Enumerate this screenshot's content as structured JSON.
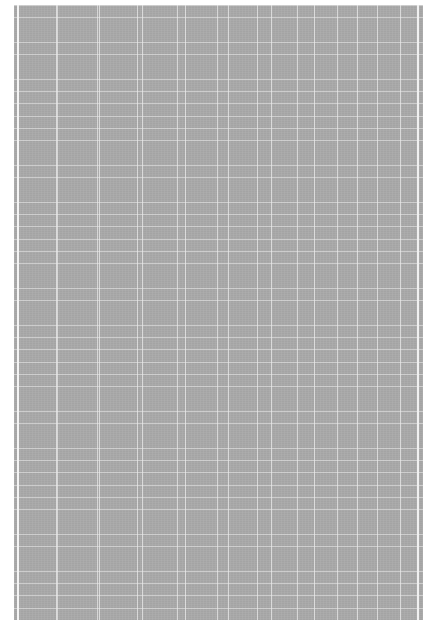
{
  "document": {
    "type": "blurred-grid-page",
    "background_color": "#ffffff",
    "page_color": "#a9a9a9",
    "grid_line_color": "#ebebeb",
    "vertical_rule_positions_px": [
      57,
      97,
      137,
      177,
      217,
      257,
      297,
      337,
      377
    ],
    "row_height_px": 12,
    "readable_text": ""
  }
}
